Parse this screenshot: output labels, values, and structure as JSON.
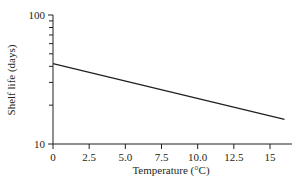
{
  "chart_data": {
    "type": "line",
    "title": "",
    "xlabel": "Temperature (°C)",
    "ylabel": "Shelf life (days)",
    "xlim": [
      0,
      16.5
    ],
    "ylim": [
      10,
      100
    ],
    "yscale": "log",
    "grid": false,
    "x_ticks": [
      "0",
      "2.5",
      "5.0",
      "7.5",
      "10.0",
      "12.5",
      "15"
    ],
    "x_tick_values": [
      0,
      2.5,
      5.0,
      7.5,
      10.0,
      12.5,
      15
    ],
    "y_ticks": [
      "10",
      "100"
    ],
    "y_tick_values": [
      10,
      100
    ],
    "series": [
      {
        "name": "Shelf life",
        "x": [
          0,
          16
        ],
        "values": [
          42,
          15.5
        ],
        "color": "#231f20"
      }
    ]
  }
}
